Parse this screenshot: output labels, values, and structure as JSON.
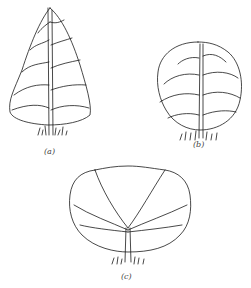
{
  "figure": {
    "panels": [
      {
        "id": "a",
        "label": "(a)",
        "shape": "conical / pyramidal crown"
      },
      {
        "id": "b",
        "label": "(b)",
        "shape": "rounded / spherical crown"
      },
      {
        "id": "c",
        "label": "(c)",
        "shape": "broad vase / spreading crown"
      }
    ]
  },
  "colors": {
    "line": "#1a1a1a",
    "background": "#ffffff"
  }
}
